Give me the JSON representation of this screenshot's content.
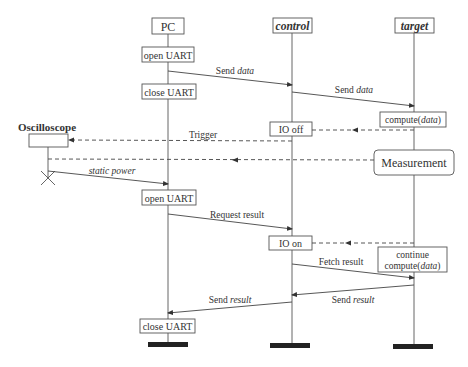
{
  "diagram": {
    "type": "sequence-diagram",
    "lifelines": [
      {
        "id": "pc",
        "label": "PC",
        "italic": false,
        "x": 168
      },
      {
        "id": "control",
        "label": "control",
        "italic": true,
        "x": 292
      },
      {
        "id": "target",
        "label": "target",
        "italic": true,
        "x": 414
      },
      {
        "id": "osc",
        "label": "Oscilloscope",
        "italic": false,
        "x": 48
      }
    ],
    "activities": {
      "pc_open1": "open UART",
      "pc_close1": "close UART",
      "pc_open2": "open UART",
      "pc_close2": "close UART",
      "ctrl_iooff": "IO off",
      "ctrl_ioon": "IO on",
      "tgt_compute_pre": "compute(",
      "tgt_compute_arg": "data",
      "tgt_compute_post": ")",
      "tgt_measure": "Measurement",
      "tgt_continue1": "continue",
      "tgt_continue2_pre": "compute(",
      "tgt_continue2_arg": "data",
      "tgt_continue2_post": ")"
    },
    "messages": {
      "m1_pre": "Send ",
      "m1_it": "data",
      "m2_pre": "Send ",
      "m2_it": "data",
      "trigger": "Trigger",
      "static_power": "static power",
      "request_result": "Request result",
      "fetch_result": "Fetch result",
      "m_send_result1_pre": "Send ",
      "m_send_result1_it": "result",
      "m_send_result2_pre": "Send ",
      "m_send_result2_it": "result"
    }
  }
}
